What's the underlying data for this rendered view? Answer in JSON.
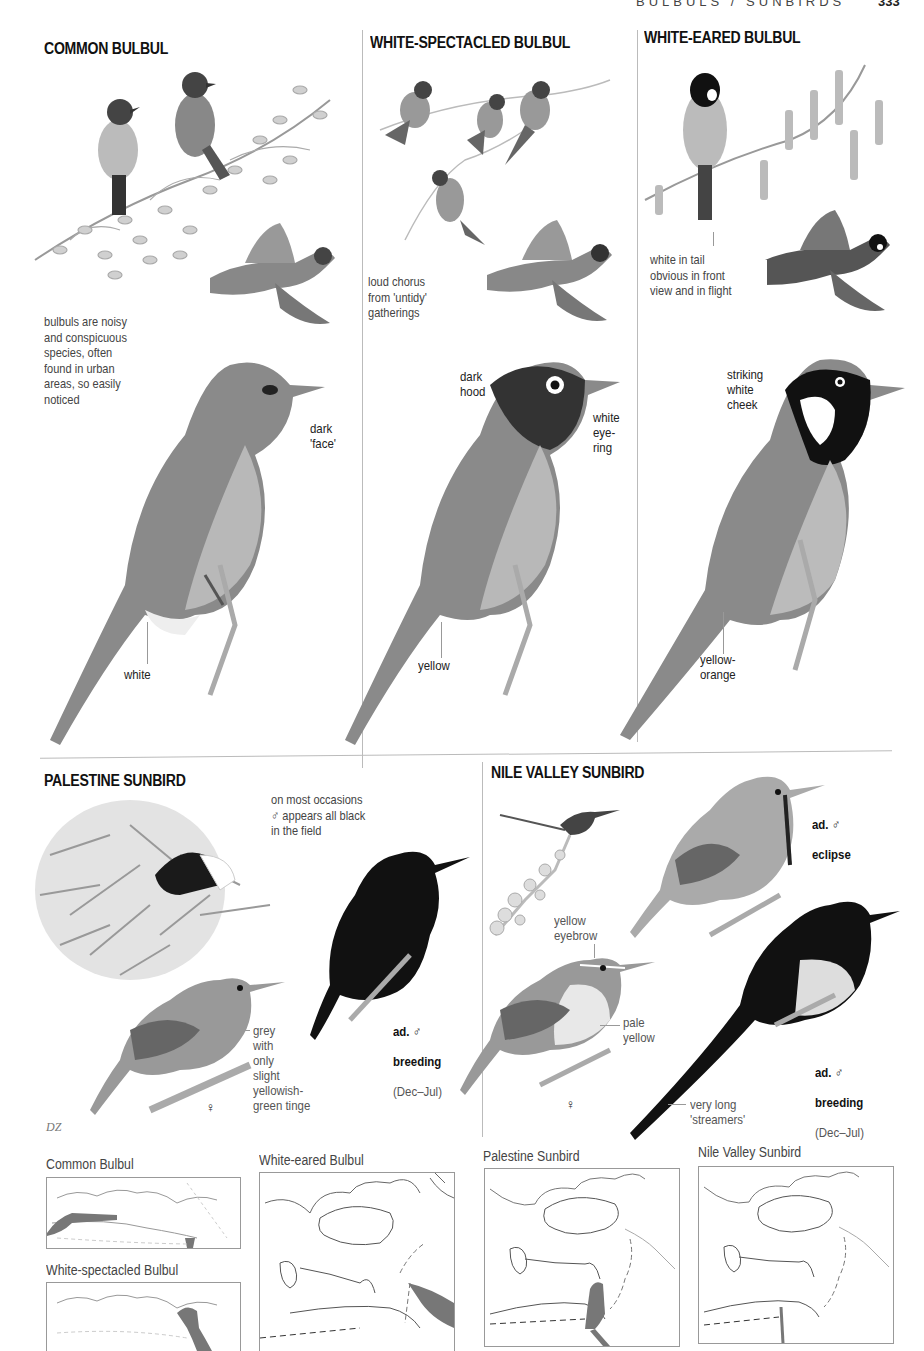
{
  "header": {
    "running_head": "BULBULS / SUNBIRDS",
    "page_number": "333"
  },
  "bulbuls": [
    {
      "title": "COMMON BULBUL",
      "note": "bulbuls are noisy\nand conspicuous\nspecies, often\nfound in urban\nareas, so easily\nnoticed",
      "labels": [
        "dark\n'face'",
        "white"
      ]
    },
    {
      "title": "WHITE-SPECTACLED BULBUL",
      "note": "loud chorus\nfrom 'untidy'\ngatherings",
      "labels": [
        "dark\nhood",
        "white\neye-\nring",
        "yellow"
      ]
    },
    {
      "title": "WHITE-EARED BULBUL",
      "note": "white in tail\nobvious in front\nview and in flight",
      "labels": [
        "striking\nwhite\ncheek",
        "yellow-\norange"
      ]
    }
  ],
  "sunbirds": [
    {
      "title": "PALESTINE SUNBIRD",
      "note": "on most occasions\n♂ appears all black\nin the field",
      "male_tag": {
        "age": "ad.",
        "sex": "♂",
        "plumage": "breeding",
        "dates": "(Dec–Jul)"
      },
      "female_label": "grey\nwith\nonly\nslight\nyellowish-\ngreen tinge",
      "female_symbol": "♀"
    },
    {
      "title": "NILE VALLEY SUNBIRD",
      "eclipse_tag": {
        "age": "ad.",
        "sex": "♂",
        "plumage": "eclipse"
      },
      "male_tag": {
        "age": "ad.",
        "sex": "♂",
        "plumage": "breeding",
        "dates": "(Dec–Jul)"
      },
      "female_labels": [
        "yellow\neyebrow",
        "pale\nyellow"
      ],
      "streamers_label": "very long\n'streamers'",
      "female_symbol": "♀"
    }
  ],
  "artist_credit": "DZ",
  "range_maps": [
    {
      "name": "Common Bulbul"
    },
    {
      "name": "White-spectacled Bulbul"
    },
    {
      "name": "White-eared Bulbul"
    },
    {
      "name": "Palestine Sunbird"
    },
    {
      "name": "Nile Valley Sunbird"
    }
  ],
  "colors": {
    "range_fill": "#777777",
    "coast_line": "#555555",
    "divider": "#bbbbbb",
    "ink": "#111111"
  }
}
